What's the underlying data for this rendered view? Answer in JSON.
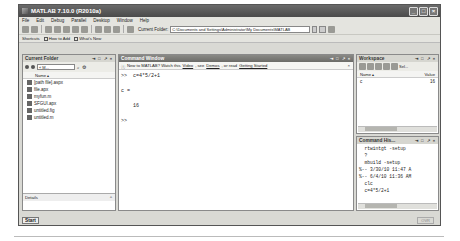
{
  "window": {
    "title": "MATLAB 7.10.0 (R2010a)",
    "controls": [
      "minimize",
      "maximize",
      "close"
    ]
  },
  "menu": [
    "File",
    "Edit",
    "Debug",
    "Parallel",
    "Desktop",
    "Window",
    "Help"
  ],
  "toolbar": {
    "current_folder_label": "Current Folder:",
    "current_folder_value": "C:\\Documents and Settings\\Administrator\\My Documents\\MATLAB"
  },
  "shortcuts": {
    "label": "Shortcuts",
    "items": [
      "How to Add",
      "What's New"
    ]
  },
  "current_folder": {
    "title": "Current Folder",
    "path_short": "« M...",
    "column": "Name ▴",
    "files": [
      "[path file].aspx",
      "file.apx",
      "myfun.m",
      "SFGUI.apx",
      "untitled.fig",
      "untitled.m"
    ],
    "details_label": "Details"
  },
  "command_window": {
    "title": "Command Window",
    "info_prefix": "New to MATLAB? Watch this",
    "info_video": "Video",
    "info_mid": ", see",
    "info_demos": "Demos",
    "info_or": ", or read",
    "info_gs": "Getting Started",
    "info_suffix": ".",
    "lines": [
      ">>  c=4*5/2+1",
      "",
      "c =",
      "",
      "    16",
      "",
      ">> "
    ]
  },
  "workspace": {
    "title": "Workspace",
    "select_placeholder": "Sel...",
    "columns": {
      "name": "Name ▴",
      "value": "Value"
    },
    "variables": [
      {
        "name": "c",
        "value": "16"
      }
    ]
  },
  "command_history": {
    "title": "Command His...",
    "entries": [
      "  rtwintgt -setup",
      "  ?",
      "  mbuild -setup",
      "%-- 3/30/10 11:47 A",
      "%-- 6/4/10 11:36 AM",
      "  clc",
      "  c=4*5/2+1"
    ]
  },
  "statusbar": {
    "start_label": "Start",
    "mode": "OVR"
  }
}
